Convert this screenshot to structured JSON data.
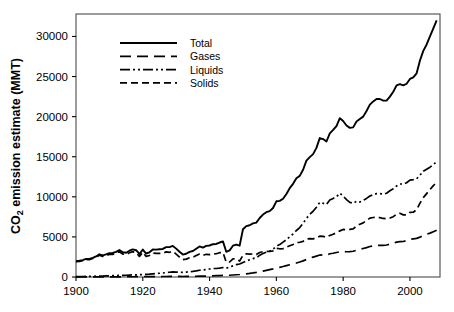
{
  "chart_data": {
    "type": "line",
    "title": "",
    "xlabel": "",
    "ylabel": "CO2 emission estimate (MMT)",
    "ylabel_parts": {
      "prefix": "CO",
      "sub": "2",
      "suffix": " emission estimate (MMT)"
    },
    "xlim": [
      1900,
      2009
    ],
    "ylim": [
      0,
      32800
    ],
    "xticks": [
      1900,
      1920,
      1940,
      1960,
      1980,
      2000
    ],
    "yticks": [
      0,
      5000,
      10000,
      15000,
      20000,
      25000,
      30000
    ],
    "xticklabels": [
      "1900",
      "1920",
      "1940",
      "1960",
      "1980",
      "2000"
    ],
    "yticklabels": [
      "0",
      "5000",
      "10000",
      "15000",
      "20000",
      "25000",
      "30000"
    ],
    "grid": false,
    "legend_position": "upper-left-inside",
    "frame_color": "#4a4a4a",
    "line_color": "#000000",
    "x": [
      1900,
      1901,
      1902,
      1903,
      1904,
      1905,
      1906,
      1907,
      1908,
      1909,
      1910,
      1911,
      1912,
      1913,
      1914,
      1915,
      1916,
      1917,
      1918,
      1919,
      1920,
      1921,
      1922,
      1923,
      1924,
      1925,
      1926,
      1927,
      1928,
      1929,
      1930,
      1931,
      1932,
      1933,
      1934,
      1935,
      1936,
      1937,
      1938,
      1939,
      1940,
      1941,
      1942,
      1943,
      1944,
      1945,
      1946,
      1947,
      1948,
      1949,
      1950,
      1951,
      1952,
      1953,
      1954,
      1955,
      1956,
      1957,
      1958,
      1959,
      1960,
      1961,
      1962,
      1963,
      1964,
      1965,
      1966,
      1967,
      1968,
      1969,
      1970,
      1971,
      1972,
      1973,
      1974,
      1975,
      1976,
      1977,
      1978,
      1979,
      1980,
      1981,
      1982,
      1983,
      1984,
      1985,
      1986,
      1987,
      1988,
      1989,
      1990,
      1991,
      1992,
      1993,
      1994,
      1995,
      1996,
      1997,
      1998,
      1999,
      2000,
      2001,
      2002,
      2003,
      2004,
      2005,
      2006,
      2007,
      2008
    ],
    "series": [
      {
        "name": "Total",
        "dash": "solid",
        "dasharray": "none",
        "width": 1.9,
        "values": [
          1960,
          2020,
          2100,
          2250,
          2250,
          2390,
          2560,
          2830,
          2690,
          2820,
          2970,
          3000,
          3130,
          3360,
          3080,
          3030,
          3280,
          3440,
          3340,
          2870,
          3420,
          2930,
          3080,
          3440,
          3410,
          3460,
          3500,
          3730,
          3730,
          3880,
          3540,
          3150,
          2800,
          2900,
          3140,
          3240,
          3530,
          3810,
          3660,
          3880,
          3930,
          4090,
          4120,
          4300,
          4440,
          3140,
          3320,
          3900,
          4050,
          3910,
          4300,
          4720,
          4780,
          4890,
          4940,
          5400,
          5720,
          5930,
          5990,
          6240,
          6550,
          6720,
          6970,
          7350,
          7700,
          8000,
          8360,
          8570,
          9020,
          9600,
          10320,
          10640,
          11060,
          11750,
          11780,
          11650,
          12280,
          12600,
          12950,
          13730,
          13110,
          12880,
          12740,
          12890,
          13410,
          13780,
          14120,
          14540,
          15040,
          15320,
          15650,
          15600,
          15460,
          15380,
          15650,
          16030,
          16420,
          16490,
          16410,
          16450,
          16860,
          16990,
          17180,
          18120,
          18900,
          19410,
          19950,
          20380,
          21000
        ],
        "values_scaled_note": "plot uses true MMT values below",
        "true_values": [
          1960,
          2020,
          2100,
          2250,
          2250,
          2390,
          2560,
          2830,
          2690,
          2820,
          2970,
          3000,
          3130,
          3360,
          3080,
          3030,
          3280,
          3440,
          3340,
          2870,
          3420,
          2930,
          3080,
          3440,
          3410,
          3460,
          3500,
          3730,
          3730,
          3880,
          3540,
          3150,
          2800,
          2900,
          3140,
          3240,
          3530,
          3810,
          3660,
          3880,
          3930,
          4090,
          4120,
          4300,
          4440,
          3140,
          3320,
          3900,
          4050,
          3910,
          5950,
          6350,
          6450,
          6680,
          6780,
          7360,
          7790,
          8080,
          8220,
          8610,
          9440,
          9500,
          9760,
          10360,
          11080,
          11620,
          12320,
          12610,
          13380,
          14520,
          14950,
          15330,
          16100,
          17330,
          17200,
          16900,
          17920,
          18350,
          18830,
          19800,
          19450,
          18900,
          18600,
          18660,
          19400,
          19700,
          20000,
          20700,
          21500,
          21900,
          22200,
          22200,
          22000,
          22000,
          22500,
          23100,
          23900,
          24050,
          23900,
          24100,
          24700,
          24900,
          25400,
          27000,
          28200,
          29000,
          30000,
          31000,
          32000
        ]
      },
      {
        "name": "Gases",
        "dash": "long-dash",
        "dasharray": "11,6",
        "width": 1.7,
        "values": [
          10,
          11,
          12,
          13,
          14,
          15,
          16,
          18,
          19,
          20,
          22,
          23,
          25,
          27,
          28,
          30,
          32,
          34,
          36,
          38,
          41,
          43,
          46,
          49,
          52,
          56,
          60,
          64,
          68,
          73,
          70,
          66,
          63,
          68,
          76,
          84,
          94,
          105,
          110,
          122,
          134,
          147,
          162,
          178,
          195,
          200,
          220,
          250,
          280,
          310,
          350,
          400,
          450,
          510,
          580,
          660,
          740,
          830,
          920,
          1010,
          1120,
          1210,
          1310,
          1420,
          1530,
          1620,
          1740,
          1870,
          2010,
          2180,
          2350,
          2480,
          2610,
          2740,
          2760,
          2720,
          2900,
          2960,
          3050,
          3150,
          3160,
          3150,
          3170,
          3210,
          3330,
          3440,
          3560,
          3670,
          3800,
          3880,
          3920,
          3960,
          3940,
          3990,
          4090,
          4200,
          4350,
          4420,
          4430,
          4530,
          4690,
          4760,
          4820,
          4970,
          5170,
          5330,
          5470,
          5650,
          5830
        ]
      },
      {
        "name": "Liquids",
        "dash": "dash-dot-dot",
        "dasharray": "10,3,2,3,2,3",
        "width": 1.7,
        "values": [
          50,
          55,
          62,
          70,
          78,
          87,
          97,
          110,
          120,
          132,
          146,
          160,
          176,
          193,
          205,
          218,
          240,
          260,
          270,
          285,
          315,
          330,
          360,
          400,
          430,
          465,
          500,
          545,
          590,
          640,
          620,
          600,
          580,
          610,
          660,
          710,
          770,
          840,
          870,
          930,
          1000,
          1060,
          1060,
          1100,
          1180,
          1100,
          1240,
          1390,
          1540,
          1620,
          1820,
          2010,
          2150,
          2300,
          2420,
          2700,
          2930,
          3100,
          3240,
          3480,
          3820,
          4040,
          4350,
          4650,
          5030,
          5360,
          5800,
          6170,
          6700,
          7300,
          7830,
          8200,
          8700,
          9320,
          9200,
          9050,
          9600,
          9800,
          10000,
          10450,
          10100,
          9650,
          9300,
          9200,
          9450,
          9350,
          9550,
          9800,
          10100,
          10250,
          10400,
          10400,
          10350,
          10450,
          10750,
          11000,
          11350,
          11600,
          11600,
          11750,
          12080,
          12150,
          12250,
          12700,
          13200,
          13450,
          13700,
          14000,
          14400
        ],
        "visual_values": [
          50,
          55,
          62,
          70,
          78,
          87,
          97,
          110,
          120,
          132,
          146,
          160,
          176,
          193,
          205,
          218,
          240,
          260,
          270,
          285,
          315,
          330,
          360,
          400,
          430,
          465,
          500,
          545,
          590,
          640,
          620,
          600,
          580,
          610,
          660,
          710,
          770,
          840,
          870,
          930,
          1000,
          1060,
          1060,
          1100,
          1180,
          1100,
          1240,
          1390,
          1540,
          1620,
          1820,
          2010,
          2150,
          2300,
          2420,
          2700,
          2930,
          3100,
          3240,
          3480,
          3820,
          4040,
          4350,
          4650,
          5030,
          5360,
          5800,
          6170,
          6700,
          7300,
          7830,
          8200,
          8700,
          9320,
          9200,
          9050,
          9600,
          9800,
          10000,
          10450,
          10100,
          9650,
          9300,
          9200,
          9450,
          9350,
          9550,
          9800,
          10100,
          10250,
          10400,
          10400,
          10350,
          10450,
          10750,
          11000,
          11350,
          11600,
          11600,
          11750,
          12080,
          12150,
          12250,
          12700,
          13200,
          13450,
          13700,
          14000,
          14400
        ]
      },
      {
        "name": "Solids",
        "dash": "medium-dash",
        "dasharray": "7,4",
        "width": 1.7,
        "values": [
          1900,
          1950,
          2030,
          2180,
          2170,
          2300,
          2460,
          2710,
          2560,
          2680,
          2810,
          2830,
          2940,
          3150,
          2860,
          2800,
          3020,
          3160,
          3050,
          2560,
          3090,
          2570,
          2680,
          2990,
          2940,
          2950,
          2950,
          3130,
          3080,
          3200,
          2860,
          2490,
          2160,
          2230,
          2410,
          2440,
          2670,
          2870,
          2690,
          2830,
          2800,
          2890,
          2900,
          3030,
          3070,
          1840,
          1870,
          2270,
          2240,
          1990,
          2700,
          2900,
          2850,
          2870,
          2800,
          3050,
          3160,
          3200,
          3180,
          3260,
          3570,
          3520,
          3540,
          3710,
          3900,
          4050,
          4290,
          4330,
          4450,
          4720,
          4790,
          4760,
          4880,
          5090,
          5070,
          4960,
          5180,
          5330,
          5520,
          5750,
          5930,
          5900,
          5930,
          6010,
          6350,
          6580,
          6750,
          7040,
          7350,
          7420,
          7430,
          7400,
          7300,
          7260,
          7350,
          7520,
          7850,
          7950,
          7750,
          7750,
          8050,
          8080,
          8400,
          9200,
          9900,
          10400,
          10900,
          11400,
          11750
        ]
      }
    ]
  },
  "legend": {
    "entries": [
      {
        "label": "Total",
        "dash": "solid"
      },
      {
        "label": "Gases",
        "dash": "long-dash"
      },
      {
        "label": "Liquids",
        "dash": "dash-dot-dot"
      },
      {
        "label": "Solids",
        "dash": "medium-dash"
      }
    ]
  },
  "axes": {
    "y_title_prefix": "CO",
    "y_title_sub": "2",
    "y_title_suffix": " emission estimate (MMT)"
  }
}
